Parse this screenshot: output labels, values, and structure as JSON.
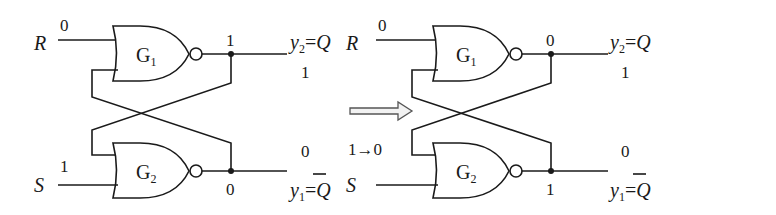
{
  "colors": {
    "line": "#1a1a1a",
    "background": "#ffffff",
    "arrow_outline": "#555555"
  },
  "transition_arrow": {
    "icon": "hollow-right-arrow"
  },
  "circuits": [
    {
      "id": "before",
      "inputs": {
        "R": {
          "label": "R",
          "value": "0"
        },
        "S": {
          "label": "S",
          "value": "1"
        }
      },
      "gates": {
        "G1": {
          "name": "G",
          "sub": "1",
          "output_value": "1"
        },
        "G2": {
          "name": "G",
          "sub": "2",
          "output_value": "0"
        }
      },
      "outputs": {
        "y2": {
          "var": "y",
          "sub": "2",
          "eq": "=",
          "rhs": "Q",
          "value": "1"
        },
        "y1": {
          "var": "y",
          "sub": "1",
          "eq": "=",
          "rhs": "Q",
          "rhs_overline": true,
          "value": "0"
        }
      }
    },
    {
      "id": "after",
      "inputs": {
        "R": {
          "label": "R",
          "value": "0"
        },
        "S": {
          "label": "S",
          "value": ""
        }
      },
      "feedback_label": "1→0",
      "gates": {
        "G1": {
          "name": "G",
          "sub": "1",
          "output_value": "0"
        },
        "G2": {
          "name": "G",
          "sub": "2",
          "output_value": "1"
        }
      },
      "outputs": {
        "y2": {
          "var": "y",
          "sub": "2",
          "eq": "=",
          "rhs": "Q",
          "value": "1"
        },
        "y1": {
          "var": "y",
          "sub": "1",
          "eq": "=",
          "rhs": "Q",
          "rhs_overline": true,
          "value": "0"
        }
      }
    }
  ]
}
